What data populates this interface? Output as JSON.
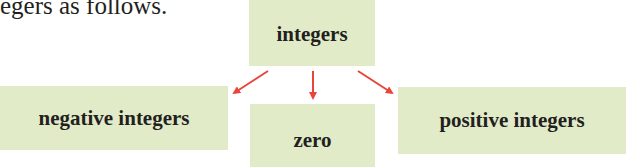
{
  "intro_text": "egers as follows.",
  "diagram": {
    "root": {
      "label": "integers"
    },
    "children": [
      {
        "label": "negative integers"
      },
      {
        "label": "zero"
      },
      {
        "label": "positive integers"
      }
    ],
    "colors": {
      "box_fill": "#e2ebc8",
      "arrow": "#e8463a",
      "text": "#231f20"
    }
  }
}
